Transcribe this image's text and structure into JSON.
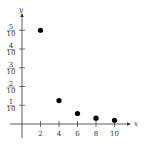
{
  "chart_data": {
    "type": "scatter",
    "title": "",
    "xlabel": "x",
    "ylabel": "y",
    "x_ticks": [
      "2",
      "4",
      "6",
      "8",
      "10"
    ],
    "y_ticks": [
      {
        "num": "1",
        "den": "10"
      },
      {
        "num": "2",
        "den": "10"
      },
      {
        "num": "3",
        "den": "10"
      },
      {
        "num": "4",
        "den": "10"
      },
      {
        "num": "5",
        "den": "10"
      }
    ],
    "x": [
      2,
      4,
      6,
      8,
      10
    ],
    "y": [
      0.5,
      0.125,
      0.056,
      0.031,
      0.02
    ],
    "xlim": [
      0,
      11
    ],
    "ylim": [
      0,
      0.6
    ],
    "grid": false,
    "marker_color": "#000000"
  }
}
